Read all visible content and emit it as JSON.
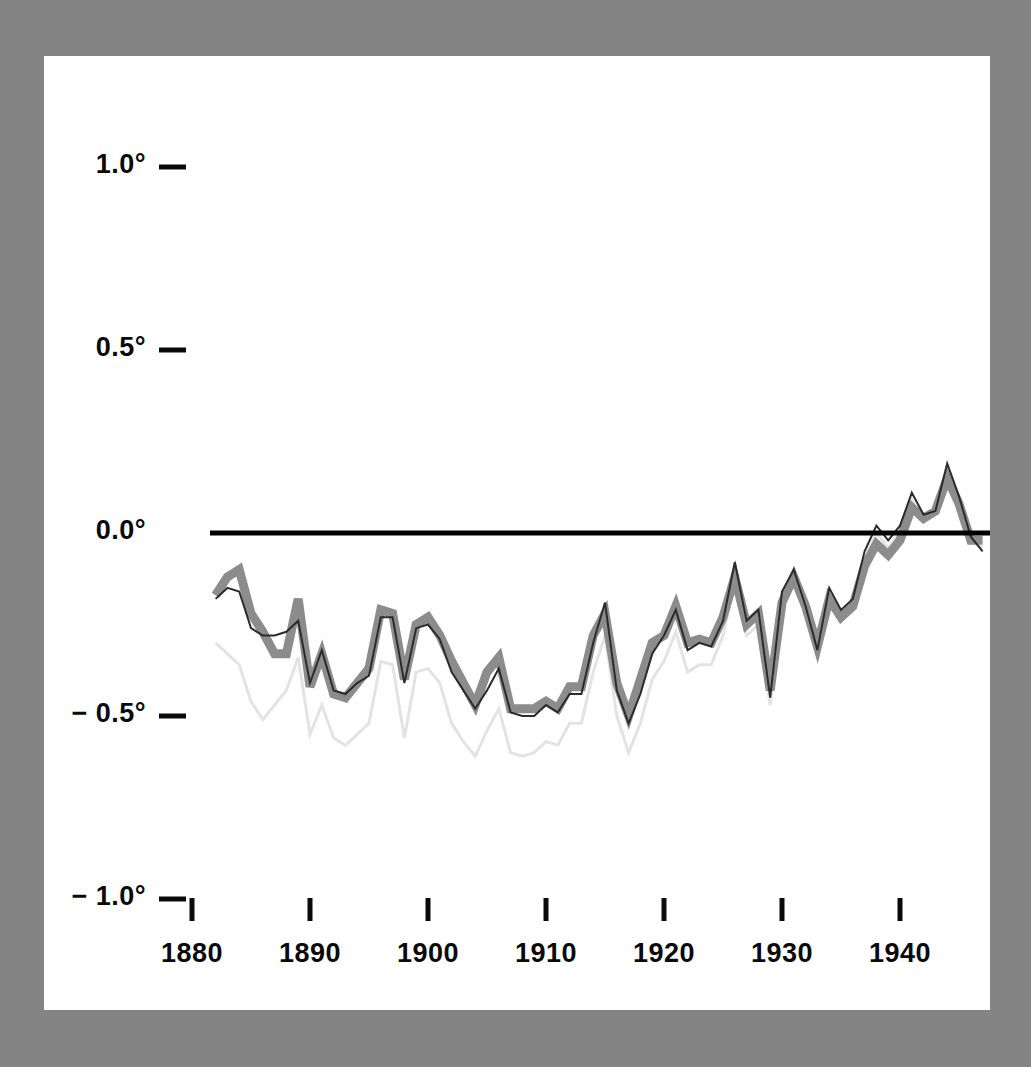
{
  "figure": {
    "background_color": "#848484",
    "panel_color": "#ffffff",
    "axis_color": "#0a0a0a"
  },
  "chart_data": {
    "type": "line",
    "title": "",
    "subtitle": "",
    "xlabel": "",
    "ylabel": "",
    "xlim": [
      1881,
      1948
    ],
    "ylim": [
      -1.25,
      1.18
    ],
    "grid": false,
    "legend": false,
    "legend_position": "none",
    "zero_reference_line": 0.0,
    "zero_line_color": "#000000",
    "x_tick_labels": [
      "1880",
      "1890",
      "1900",
      "1910",
      "1920",
      "1930",
      "1940"
    ],
    "x_ticks": [
      1880,
      1890,
      1900,
      1910,
      1920,
      1930,
      1940
    ],
    "y_tick_labels": [
      "1.0°",
      "0.5°",
      "0.0°",
      "− 0.5°",
      "− 1.0°"
    ],
    "y_ticks": [
      1.0,
      0.5,
      0.0,
      -0.5,
      -1.0
    ],
    "x": [
      1882,
      1883,
      1884,
      1885,
      1886,
      1887,
      1888,
      1889,
      1890,
      1891,
      1892,
      1893,
      1894,
      1895,
      1896,
      1897,
      1898,
      1899,
      1900,
      1901,
      1902,
      1903,
      1904,
      1905,
      1906,
      1907,
      1908,
      1909,
      1910,
      1911,
      1912,
      1913,
      1914,
      1915,
      1916,
      1917,
      1918,
      1919,
      1920,
      1921,
      1922,
      1923,
      1924,
      1925,
      1926,
      1927,
      1928,
      1929,
      1930,
      1931,
      1932,
      1933,
      1934,
      1935,
      1936,
      1937,
      1938,
      1939,
      1940,
      1941,
      1942,
      1943,
      1944,
      1945,
      1946,
      1947
    ],
    "series": [
      {
        "name": "thick-gray-series",
        "color": "#8c8c8c",
        "width": 9,
        "values": [
          -0.17,
          -0.12,
          -0.1,
          -0.22,
          -0.27,
          -0.33,
          -0.33,
          -0.18,
          -0.42,
          -0.33,
          -0.44,
          -0.45,
          -0.41,
          -0.37,
          -0.21,
          -0.22,
          -0.4,
          -0.25,
          -0.23,
          -0.28,
          -0.35,
          -0.41,
          -0.47,
          -0.38,
          -0.34,
          -0.48,
          -0.48,
          -0.48,
          -0.46,
          -0.48,
          -0.42,
          -0.42,
          -0.28,
          -0.22,
          -0.41,
          -0.5,
          -0.4,
          -0.3,
          -0.28,
          -0.2,
          -0.3,
          -0.29,
          -0.3,
          -0.23,
          -0.12,
          -0.25,
          -0.22,
          -0.43,
          -0.19,
          -0.12,
          -0.2,
          -0.31,
          -0.18,
          -0.23,
          -0.2,
          -0.09,
          -0.03,
          -0.06,
          -0.02,
          0.07,
          0.04,
          0.06,
          0.15,
          0.08,
          -0.02,
          -0.02
        ]
      },
      {
        "name": "thin-dark-series",
        "color": "#2b2b2b",
        "width": 2,
        "values": [
          -0.18,
          -0.15,
          -0.16,
          -0.26,
          -0.28,
          -0.28,
          -0.27,
          -0.24,
          -0.41,
          -0.32,
          -0.43,
          -0.44,
          -0.41,
          -0.39,
          -0.23,
          -0.23,
          -0.41,
          -0.26,
          -0.25,
          -0.29,
          -0.38,
          -0.43,
          -0.48,
          -0.43,
          -0.37,
          -0.49,
          -0.5,
          -0.5,
          -0.47,
          -0.49,
          -0.44,
          -0.44,
          -0.3,
          -0.19,
          -0.43,
          -0.52,
          -0.44,
          -0.33,
          -0.28,
          -0.21,
          -0.32,
          -0.3,
          -0.31,
          -0.24,
          -0.08,
          -0.24,
          -0.21,
          -0.45,
          -0.16,
          -0.1,
          -0.2,
          -0.32,
          -0.15,
          -0.21,
          -0.18,
          -0.05,
          0.02,
          -0.02,
          0.02,
          0.11,
          0.05,
          0.06,
          0.19,
          0.1,
          -0.01,
          -0.05
        ]
      },
      {
        "name": "light-gray-series",
        "color": "#e3e3e3",
        "width": 3,
        "values": [
          -0.3,
          -0.33,
          -0.36,
          -0.46,
          -0.51,
          -0.47,
          -0.43,
          -0.34,
          -0.55,
          -0.47,
          -0.56,
          -0.58,
          -0.55,
          -0.52,
          -0.35,
          -0.36,
          -0.56,
          -0.38,
          -0.37,
          -0.41,
          -0.52,
          -0.57,
          -0.61,
          -0.54,
          -0.48,
          -0.6,
          -0.61,
          -0.6,
          -0.57,
          -0.58,
          -0.52,
          -0.52,
          -0.38,
          -0.28,
          -0.5,
          -0.6,
          -0.52,
          -0.4,
          -0.35,
          -0.27,
          -0.38,
          -0.36,
          -0.36,
          -0.28,
          -0.13,
          -0.28,
          -0.25,
          -0.47,
          -0.19,
          -0.13,
          -0.22,
          -0.33,
          -0.17,
          -0.22,
          -0.19,
          -0.07,
          0.0,
          -0.04,
          0.0,
          0.09,
          0.03,
          0.05,
          0.17,
          0.09,
          -0.02,
          -0.04
        ]
      }
    ]
  }
}
